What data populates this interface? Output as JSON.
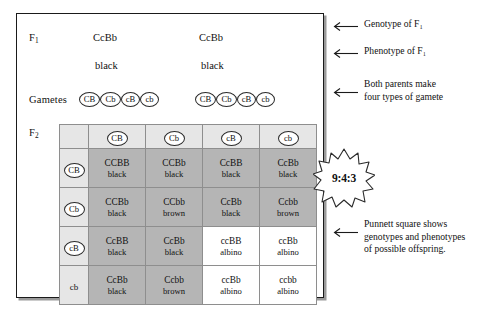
{
  "diagram": {
    "generation_labels": {
      "f1": "F",
      "f1_sub": "1",
      "f2": "F",
      "f2_sub": "2",
      "gametes": "Gametes"
    },
    "parents": [
      {
        "genotype": "CcBb",
        "phenotype": "black"
      },
      {
        "genotype": "CcBb",
        "phenotype": "black"
      }
    ],
    "gamete_sets": [
      [
        "CB",
        "Cb",
        "cB",
        "cb"
      ],
      [
        "CB",
        "Cb",
        "cB",
        "cb"
      ]
    ],
    "ratio_badge": "9:4:3"
  },
  "punnett": {
    "column_headers": [
      {
        "label": "CB",
        "circled": true
      },
      {
        "label": "Cb",
        "circled": true
      },
      {
        "label": "cB",
        "circled": true
      },
      {
        "label": "cb",
        "circled": true
      }
    ],
    "row_headers": [
      {
        "label": "CB",
        "circled": true
      },
      {
        "label": "Cb",
        "circled": true
      },
      {
        "label": "cB",
        "circled": true
      },
      {
        "label": "cb",
        "circled": false
      }
    ],
    "rows": [
      [
        {
          "genotype": "CCBB",
          "phenotype": "black",
          "shaded": true
        },
        {
          "genotype": "CCBb",
          "phenotype": "black",
          "shaded": true
        },
        {
          "genotype": "CcBB",
          "phenotype": "black",
          "shaded": true
        },
        {
          "genotype": "CcBb",
          "phenotype": "black",
          "shaded": true
        }
      ],
      [
        {
          "genotype": "CCBb",
          "phenotype": "black",
          "shaded": true
        },
        {
          "genotype": "CCbb",
          "phenotype": "brown",
          "shaded": true
        },
        {
          "genotype": "CcBb",
          "phenotype": "black",
          "shaded": true
        },
        {
          "genotype": "Ccbb",
          "phenotype": "brown",
          "shaded": true
        }
      ],
      [
        {
          "genotype": "CcBB",
          "phenotype": "black",
          "shaded": true
        },
        {
          "genotype": "CcBb",
          "phenotype": "black",
          "shaded": true
        },
        {
          "genotype": "ccBB",
          "phenotype": "albino",
          "shaded": false
        },
        {
          "genotype": "ccBb",
          "phenotype": "albino",
          "shaded": false
        }
      ],
      [
        {
          "genotype": "CcBb",
          "phenotype": "black",
          "shaded": true
        },
        {
          "genotype": "Ccbb",
          "phenotype": "brown",
          "shaded": true
        },
        {
          "genotype": "ccBb",
          "phenotype": "albino",
          "shaded": false
        },
        {
          "genotype": "ccbb",
          "phenotype": "albino",
          "shaded": false
        }
      ]
    ]
  },
  "annotations": [
    {
      "lines": [
        "Genotype of F₁"
      ]
    },
    {
      "lines": [
        "Phenotype of F₁"
      ]
    },
    {
      "lines": [
        "Both parents make",
        "four types of gamete"
      ]
    },
    {
      "lines": [
        "Punnett square shows",
        "genotypes and phenotypes",
        "of possible offspring."
      ]
    }
  ],
  "colors": {
    "shaded_cell": "#b5b5b5",
    "header_cell": "#e6e6e6",
    "white_cell": "#ffffff",
    "border": "#1a1a1a",
    "grid_line": "#8e8e8e"
  }
}
